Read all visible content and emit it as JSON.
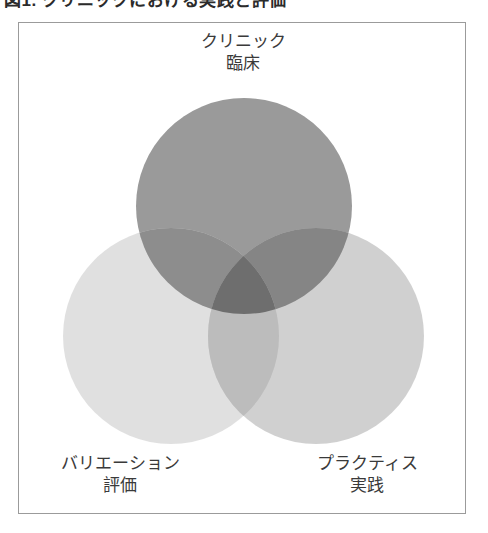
{
  "caption": {
    "text": "図1.  クリニックにおける実践と評価"
  },
  "frame": {
    "border_color": "#9b9b9b"
  },
  "chart_data": {
    "type": "venn",
    "title": "",
    "sets": [
      {
        "id": "clinic",
        "label_line1": "クリニック",
        "label_line2": "臨床",
        "position": "top",
        "color": "#9a9a9a",
        "cx": 225,
        "cy": 183,
        "r": 108
      },
      {
        "id": "variation",
        "label_line1": "バリエーション",
        "label_line2": "評価",
        "position": "bottom-left",
        "color": "#dcdcdc",
        "cx": 152,
        "cy": 313,
        "r": 108
      },
      {
        "id": "practice",
        "label_line1": "プラクティス",
        "label_line2": "実践",
        "position": "bottom-right",
        "color": "#c9c9c9",
        "cx": 297,
        "cy": 313,
        "r": 108
      }
    ],
    "overlaps": [
      {
        "id": "clinic-variation",
        "color": "#8d8d8d"
      },
      {
        "id": "clinic-practice",
        "color": "#858585"
      },
      {
        "id": "variation-practice",
        "color": "#bcbcbc"
      },
      {
        "id": "clinic-variation-practice",
        "color": "#6e6e6e"
      }
    ],
    "legend": "none",
    "grid": false
  }
}
